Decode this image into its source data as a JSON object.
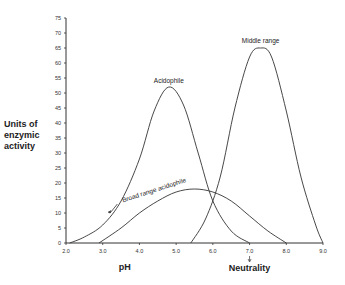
{
  "chart_data": {
    "type": "line",
    "title": "",
    "xlabel": "pH",
    "ylabel": "Units of enzymic activity",
    "ylabel_lines": [
      "Units of",
      "enzymic",
      "activity"
    ],
    "xlim": [
      2.0,
      9.0
    ],
    "ylim": [
      0,
      75
    ],
    "x_ticks": [
      "2.0",
      "3.0",
      "4.0",
      "5.0",
      "6.0",
      "7.0",
      "8.0",
      "9.0"
    ],
    "y_ticks": [
      "0",
      "5",
      "10",
      "15",
      "20",
      "25",
      "30",
      "35",
      "40",
      "45",
      "50",
      "55",
      "60",
      "65",
      "70",
      "75"
    ],
    "grid": false,
    "annotations": [
      {
        "text": "Neutrality",
        "x": 7.0,
        "note": "arrow pointing to pH 7.0"
      },
      {
        "text": "Acidophile",
        "x": 4.8,
        "y": 52
      },
      {
        "text": "Middle range",
        "x": 7.3,
        "y": 65
      },
      {
        "text": "Broad range acidophile",
        "x": 4.0,
        "y": 14
      }
    ],
    "series": [
      {
        "name": "Acidophile",
        "x": [
          2.1,
          2.5,
          3.0,
          3.5,
          4.0,
          4.4,
          4.8,
          5.2,
          5.6,
          6.0,
          6.5,
          7.0
        ],
        "values": [
          0,
          2,
          6,
          14,
          28,
          44,
          52,
          46,
          30,
          14,
          4,
          0
        ]
      },
      {
        "name": "Broad range acidophile",
        "x": [
          2.9,
          3.5,
          4.0,
          4.5,
          5.0,
          5.5,
          6.0,
          6.5,
          7.0,
          7.5,
          8.0
        ],
        "values": [
          0,
          5,
          10,
          14,
          17,
          18,
          17,
          14,
          9,
          4,
          0
        ]
      },
      {
        "name": "Middle range",
        "x": [
          5.4,
          5.8,
          6.2,
          6.6,
          7.0,
          7.3,
          7.6,
          8.0,
          8.4,
          8.8,
          9.0
        ],
        "values": [
          0,
          8,
          22,
          45,
          62,
          65,
          62,
          44,
          22,
          6,
          0
        ]
      }
    ]
  }
}
